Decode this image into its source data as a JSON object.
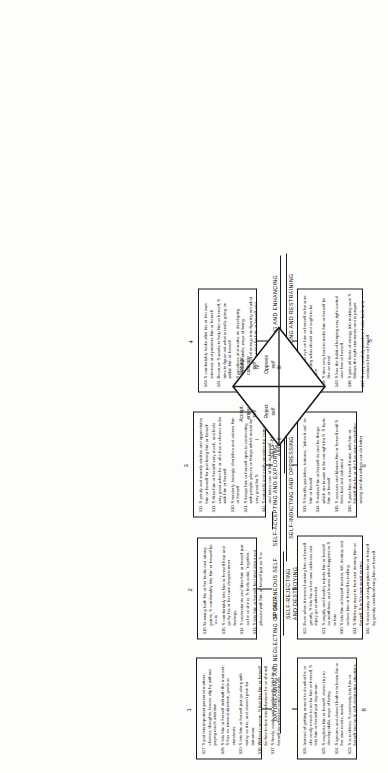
{
  "diagram": {
    "center": {
      "quadrants": [
        {
          "roman": "I",
          "label": "Accept,\nenjoy\nself"
        },
        {
          "roman": "II",
          "label": "Reject\nself"
        },
        {
          "roman": "III",
          "label": "Oppress\nself"
        },
        {
          "roman": "IV",
          "label": "Manage,\ncultivate\nself"
        }
      ]
    },
    "group_titles": [
      {
        "id": "daydreaming",
        "text": "DAYDREAMING AND NEGLECTING OF SELF"
      },
      {
        "id": "spontaneous",
        "text": "SPONTANEOUS SELF"
      },
      {
        "id": "accepting",
        "text": "SELF-ACCEPTING AND EXPLORING"
      },
      {
        "id": "nourishing",
        "text": "SELF-NOURISHING\nAND CHERISHING"
      },
      {
        "id": "protecting",
        "text": "SELF-PROTECTING AND ENHANCING"
      },
      {
        "id": "monitoring",
        "text": "SELF-MONITORING AND RESTRAINING"
      },
      {
        "id": "indicting",
        "text": "SELF-INDICTING AND OPPRESSING"
      },
      {
        "id": "rejecting",
        "text": "SELF-REJECTING\nAND DESTROYING"
      }
    ],
    "boxes": [
      {
        "label": "1",
        "items": [
          {
            "n": "327.",
            "t": "S just lets important personal matters, choices, thoughts, issues slip by without paying much attention."
          },
          {
            "n": "328.",
            "t": "S lets him or herself drift with the moment; S has no internal direction, goals or standards."
          },
          {
            "n": "320.",
            "t": "S lets him or herself just go along with today as it is, and doesn't plan for tomorrow."
          },
          {
            "n": "318.",
            "t": "Without concern, S just lets him or herself be free to turn into whatever he or she will."
          },
          {
            "n": "317.",
            "t": "S freely, easily and confidently lets him or herself do whatever comes naturally."
          }
        ]
      },
      {
        "label": "2",
        "items": [
          {
            "n": "316.",
            "t": "Knowing both his or her faults and strong points, S comfortably lets him or herself be \"as is.\""
          },
          {
            "n": "315.",
            "t": "S comfortably lets him or herself hear and go by his or her own deepest inner feelings."
          },
          {
            "n": "314.",
            "t": "S understands and likes him or herself just as he or she is. S feels solid, \"together.\""
          },
          {
            "n": "313.",
            "t": "S lets him or herself feel glad about and pleased with him or herself just as S is."
          }
        ]
      },
      {
        "label": "3",
        "items": [
          {
            "n": "312.",
            "t": "S gently and warmly strokes and appreciates him or herself for just being him or herself."
          },
          {
            "n": "311.",
            "t": "S likes him or herself very much, and feels very good when he or she has a chance to be with him or herself."
          },
          {
            "n": "310.",
            "t": "S tenderly, lovingly cherishes and adores him or herself."
          },
          {
            "n": "341.",
            "t": "S keeps him or herself open to connecting with people, places or things which would be very good for S."
          },
          {
            "n": "342.",
            "t": "S naturally and easily provides for, nurtures and takes care of him or herself."
          }
        ]
      },
      {
        "label": "4",
        "items": [
          {
            "n": "343.",
            "t": "S comfortably looks after his or her own interests and protects him or herself."
          },
          {
            "n": "344.",
            "t": "Because S wants to help him or herself, S tries to figure out what is really going on within him or herself."
          },
          {
            "n": "345.",
            "t": "S practices and works on developing worthwhile skills, ways of being."
          },
          {
            "n": "346.",
            "t": "S puts a lot of energy into figuring out what S is going to need for him or herself and how to get it."
          }
        ]
      },
      {
        "label": "5",
        "items": [
          {
            "n": "347.",
            "t": "S keeps an eye on him or herself to be sure S is doing what should and ought to be done."
          },
          {
            "n": "348.",
            "t": "S tries very hard to make him or herself be like an ideal."
          },
          {
            "n": "340.",
            "t": "S has the habit of keeping very tight control over him or herself."
          },
          {
            "n": "338.",
            "t": "S puts all kinds of energy into making sure S follows the right standards and is proper."
          },
          {
            "n": "337.",
            "t": "S very carefully watches, holds back and restrains him or herself."
          }
        ]
      },
      {
        "label": "6",
        "items": [
          {
            "n": "333.",
            "t": "S harshly punishes, tortures, \"takes it out\" on him or herself."
          },
          {
            "n": "334.",
            "t": "S makes him or herself do and be things which are known to be not right for S. S fools him or herself."
          },
          {
            "n": "335.",
            "t": "S accuses and blames him or herself until S feels bad and ashamed."
          },
          {
            "n": "336.",
            "t": "S puts him or herself down, tells him or herself that he or she has done everything wrong and that others can do better."
          }
        ]
      },
      {
        "label": "7",
        "items": [
          {
            "n": "322.",
            "t": "Even when it means harming him or herself greatly, S lets his or her own sickness and injury go unattended."
          },
          {
            "n": "321.",
            "t": "S angrily and harshly rejects him or herself as worthless, and leaves what happens to S to fate."
          },
          {
            "n": "330.",
            "t": "S lets him or herself murder, kill, destroy and reduce him or herself to nothing."
          },
          {
            "n": "331.",
            "t": "S thinks up ways to hurt and destroy him or herself. S is S's own worst enemy."
          },
          {
            "n": "332.",
            "t": "S tears away at and empties him or herself by greatly overburdening him or herself."
          }
        ]
      },
      {
        "label": "8",
        "items": [
          {
            "n": "326.",
            "t": "Instead of getting around to do what he or she really needs to do for him or herself, S lets him or herself just daydream."
          },
          {
            "n": "325.",
            "t": "S neglects him or herself, doesn't try to develop skills, ways of being."
          },
          {
            "n": "324.",
            "t": "S ignores and doesn't bother to know his or her own needs, wants."
          },
          {
            "n": "323.",
            "t": "S is reckless; S carelessly lets him or herself end up in self-destructive situations."
          }
        ]
      }
    ]
  }
}
